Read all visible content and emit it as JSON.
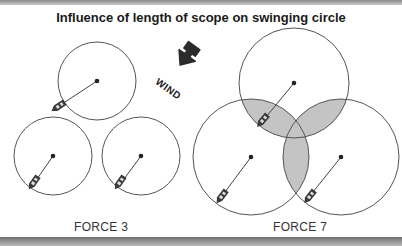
{
  "title": "Influence of length of scope on swinging circle",
  "wind": {
    "label": "WIND",
    "icon": "wind-direction-arrow-icon",
    "color": "#2b2b2b"
  },
  "groups": [
    {
      "label": "FORCE 3",
      "circles": [
        {
          "cx": 97,
          "cy": 81,
          "r": 39,
          "boat": [
            60,
            107
          ]
        },
        {
          "cx": 53,
          "cy": 156,
          "r": 39,
          "boat": [
            34,
            182
          ]
        },
        {
          "cx": 141,
          "cy": 156,
          "r": 39,
          "boat": [
            120,
            182
          ]
        }
      ],
      "overlap": false
    },
    {
      "label": "FORCE 7",
      "circles": [
        {
          "cx": 294,
          "cy": 83,
          "r": 55,
          "boat": [
            263,
            120
          ]
        },
        {
          "cx": 251,
          "cy": 157,
          "r": 58,
          "boat": [
            222,
            196
          ]
        },
        {
          "cx": 341,
          "cy": 157,
          "r": 58,
          "boat": [
            310,
            196
          ]
        }
      ],
      "overlap": true,
      "overlap_color": "#c4c4c4"
    }
  ],
  "colors": {
    "circle_stroke": "#555555",
    "boat": "#3a3a3a",
    "bars": "#8a8a8a"
  }
}
